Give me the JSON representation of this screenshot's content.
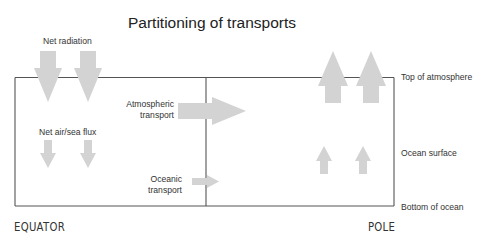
{
  "title": "Partitioning of transports",
  "labels": {
    "net_radiation": "Net radiation",
    "net_air_sea_flux": "Net air/sea flux",
    "atmospheric_transport_line1": "Atmospheric",
    "atmospheric_transport_line2": "transport",
    "oceanic_transport_line1": "Oceanic",
    "oceanic_transport_line2": "transport",
    "top_of_atmosphere": "Top of atmosphere",
    "ocean_surface": "Ocean surface",
    "bottom_of_ocean": "Bottom of ocean",
    "equator": "EQUATOR",
    "pole": "POLE"
  },
  "colors": {
    "arrow_fill": "#d3d3d3",
    "box_stroke": "#555555",
    "text": "#333333"
  },
  "arrows": [
    {
      "name": "net-radiation-arrow",
      "direction": "down",
      "count": 2,
      "size": "large"
    },
    {
      "name": "net-air-sea-flux-arrow",
      "direction": "down",
      "count": 2,
      "size": "small"
    },
    {
      "name": "atmospheric-transport-arrow",
      "direction": "right",
      "count": 1,
      "size": "large"
    },
    {
      "name": "oceanic-transport-arrow",
      "direction": "right",
      "count": 1,
      "size": "small"
    },
    {
      "name": "pole-top-of-atmosphere-arrow",
      "direction": "up",
      "count": 2,
      "size": "large"
    },
    {
      "name": "pole-ocean-surface-arrow",
      "direction": "up",
      "count": 2,
      "size": "small"
    }
  ]
}
